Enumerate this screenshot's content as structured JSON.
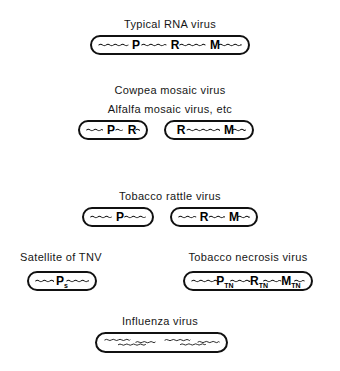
{
  "figure": {
    "background_color": "#ffffff",
    "stroke_color": "#111111",
    "text_color": "#161616"
  },
  "rows": [
    {
      "id": "typical-rna-virus",
      "captions": [
        {
          "text": "Typical RNA virus",
          "cx": 170,
          "y": 18
        }
      ],
      "particles": [
        {
          "id": "typical-rna-virus-particle",
          "x": 90,
          "y": 35,
          "w": 160,
          "h": 20,
          "genes": [
            {
              "label": "P",
              "sub": "",
              "cx": 44
            },
            {
              "label": "R",
              "sub": "",
              "cx": 83
            },
            {
              "label": "M",
              "sub": "",
              "cx": 123
            }
          ]
        }
      ]
    },
    {
      "id": "cowpea-alfalfa-mosaic-virus",
      "captions": [
        {
          "text": "Cowpea mosaic virus",
          "cx": 170,
          "y": 84
        },
        {
          "text": "Alfalfa mosaic virus, etc",
          "cx": 170,
          "y": 103
        }
      ],
      "particles": [
        {
          "id": "cowpea-alfalfa-particle-left",
          "x": 78,
          "y": 120,
          "w": 70,
          "h": 20,
          "genes": [
            {
              "label": "P",
              "sub": "",
              "cx": 31
            },
            {
              "label": "R",
              "sub": "",
              "cx": 52
            }
          ]
        },
        {
          "id": "cowpea-alfalfa-particle-right",
          "x": 164,
          "y": 120,
          "w": 90,
          "h": 20,
          "genes": [
            {
              "label": "R",
              "sub": "",
              "cx": 15
            },
            {
              "label": "M",
              "sub": "",
              "cx": 63
            }
          ]
        }
      ]
    },
    {
      "id": "tobacco-rattle-virus",
      "captions": [
        {
          "text": "Tobacco rattle virus",
          "cx": 170,
          "y": 190
        }
      ],
      "particles": [
        {
          "id": "tobacco-rattle-particle-left",
          "x": 82,
          "y": 207,
          "w": 72,
          "h": 20,
          "genes": [
            {
              "label": "P",
              "sub": "",
              "cx": 36
            }
          ]
        },
        {
          "id": "tobacco-rattle-particle-right",
          "x": 170,
          "y": 207,
          "w": 88,
          "h": 20,
          "genes": [
            {
              "label": "R",
              "sub": "",
              "cx": 32
            },
            {
              "label": "M",
              "sub": "",
              "cx": 62
            }
          ]
        }
      ]
    },
    {
      "id": "satellite-and-necrosis",
      "captions": [
        {
          "text": "Satellite of TNV",
          "cx": 61,
          "y": 251
        },
        {
          "text": "Tobacco necrosis virus",
          "cx": 248,
          "y": 251
        }
      ],
      "particles": [
        {
          "id": "satellite-tnv-particle",
          "x": 27,
          "y": 271,
          "w": 70,
          "h": 20,
          "genes": [
            {
              "label": "P",
              "sub": "s",
              "cx": 33
            }
          ]
        },
        {
          "id": "tobacco-necrosis-particle",
          "x": 183,
          "y": 271,
          "w": 130,
          "h": 20,
          "genes": [
            {
              "label": "P",
              "sub": "TN",
              "cx": 40
            },
            {
              "label": "R",
              "sub": "TN",
              "cx": 74
            },
            {
              "label": "M",
              "sub": "TN",
              "cx": 106
            }
          ]
        }
      ]
    },
    {
      "id": "influenza-virus",
      "captions": [
        {
          "text": "Influenza virus",
          "cx": 160,
          "y": 315
        }
      ],
      "particles": [
        {
          "id": "influenza-particle",
          "x": 95,
          "y": 332,
          "w": 133,
          "h": 21,
          "genes": []
        }
      ]
    }
  ]
}
